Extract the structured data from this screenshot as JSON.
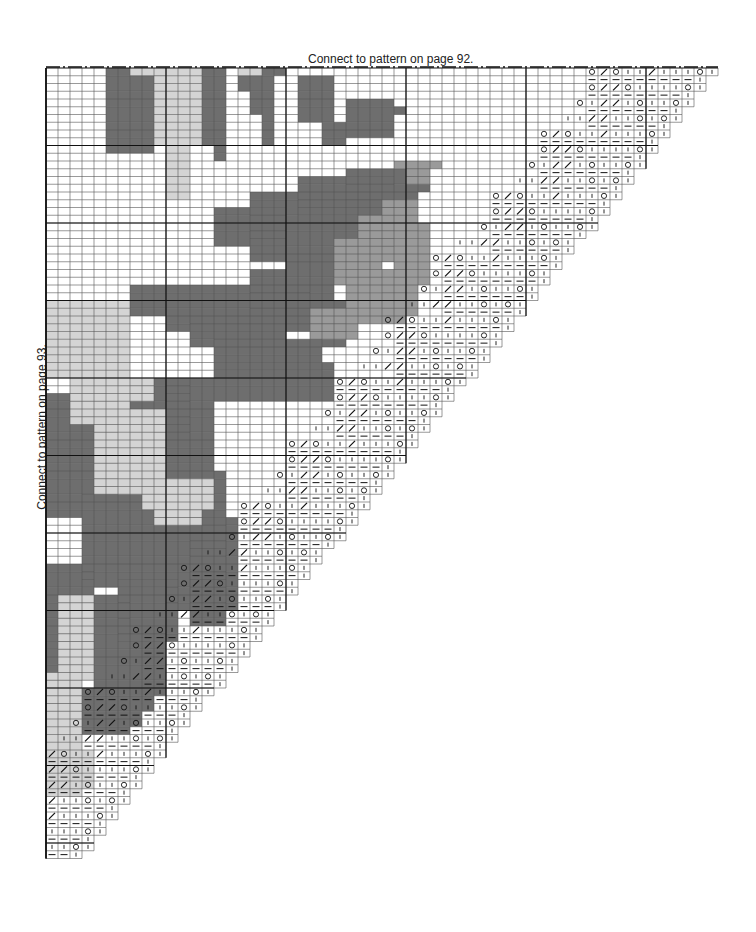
{
  "labels": {
    "top": "Connect to pattern on page 92.",
    "side": "Connect to pattern on page 93."
  },
  "grid": {
    "origin_x": 46,
    "origin_y": 68,
    "cell_w": 12,
    "cell_h": 7.75,
    "cols": 56,
    "rows": 102,
    "major_every": 10
  },
  "colors": {
    "dark": "#6e6e6e",
    "medium": "#9a9a9a",
    "light": "#d4d4d4",
    "grid_line": "#555555",
    "major_line": "#111111"
  },
  "symbols": {
    "yo": "O",
    "k2tog": "/",
    "knit": "ı",
    "purl": "—"
  },
  "lace_rows": [
    [
      "O",
      "/",
      "O",
      "|",
      "|",
      "/",
      "|",
      "|",
      "|",
      "O",
      "|"
    ],
    [
      "—",
      "—",
      "—",
      "—",
      "—",
      "—",
      "—",
      "—",
      "—",
      "|"
    ],
    [
      "O",
      "/",
      "/",
      "O",
      "|",
      "|",
      "|",
      "|",
      "O",
      "|"
    ],
    [
      "—",
      "—",
      "—",
      "—",
      "—",
      "—",
      "—",
      "—",
      "|"
    ],
    [
      "O",
      "|",
      "/",
      "/",
      "|",
      "O",
      "|",
      "|",
      "O",
      "|"
    ],
    [
      "—",
      "—",
      "—",
      "—",
      "—",
      "—",
      "—",
      "|"
    ],
    [
      "|",
      "|",
      "/",
      "/",
      "|",
      "|",
      "O",
      "|",
      "O",
      "|"
    ],
    [
      "—",
      "—",
      "—",
      "—",
      "—",
      "—",
      "|"
    ]
  ],
  "shading": [
    {
      "shade": "dark",
      "rects": [
        [
          5,
          0,
          4,
          11
        ],
        [
          9,
          0,
          1,
          1
        ],
        [
          13,
          0,
          2,
          10
        ],
        [
          14,
          10,
          1,
          2
        ],
        [
          16,
          0,
          3,
          3
        ],
        [
          17,
          3,
          2,
          3
        ],
        [
          18,
          6,
          1,
          4
        ],
        [
          19,
          0,
          1,
          1
        ],
        [
          21,
          1,
          3,
          6
        ],
        [
          23,
          7,
          2,
          3
        ],
        [
          25,
          4,
          4,
          5
        ],
        [
          29,
          5,
          1,
          1
        ],
        [
          30,
          12,
          2,
          4
        ],
        [
          25,
          13,
          5,
          4
        ],
        [
          21,
          14,
          8,
          5
        ],
        [
          17,
          16,
          14,
          4
        ],
        [
          14,
          18,
          6,
          5
        ],
        [
          17,
          20,
          12,
          5
        ],
        [
          20,
          24,
          4,
          7
        ],
        [
          22,
          30,
          3,
          6
        ],
        [
          17,
          26,
          3,
          6
        ],
        [
          20,
          29,
          2,
          4
        ],
        [
          7,
          28,
          3,
          4
        ],
        [
          10,
          28,
          12,
          6
        ],
        [
          12,
          32,
          8,
          4
        ],
        [
          14,
          35,
          9,
          4
        ],
        [
          14,
          38,
          10,
          5
        ],
        [
          7,
          40,
          5,
          8
        ],
        [
          10,
          40,
          4,
          12
        ],
        [
          3,
          42,
          3,
          14
        ],
        [
          0,
          42,
          3,
          16
        ],
        [
          3,
          55,
          7,
          12
        ],
        [
          10,
          52,
          5,
          18
        ],
        [
          12,
          58,
          4,
          14
        ],
        [
          6,
          66,
          5,
          8
        ],
        [
          0,
          64,
          4,
          11
        ],
        [
          4,
          68,
          3,
          12
        ],
        [
          0,
          74,
          3,
          10
        ],
        [
          7,
          72,
          3,
          12
        ],
        [
          7,
          84,
          6,
          5
        ],
        [
          3,
          80,
          4,
          6
        ],
        [
          11,
          78,
          3,
          6
        ],
        [
          12,
          82,
          2,
          3
        ]
      ]
    },
    {
      "shade": "medium",
      "rects": [
        [
          28,
          17,
          3,
          4
        ],
        [
          30,
          12,
          2,
          3
        ],
        [
          26,
          19,
          3,
          6
        ],
        [
          24,
          22,
          4,
          6
        ],
        [
          29,
          20,
          3,
          8
        ],
        [
          25,
          26,
          5,
          7
        ],
        [
          22,
          31,
          4,
          4
        ],
        [
          28,
          28,
          3,
          4
        ],
        [
          29,
          12,
          4,
          1
        ]
      ]
    },
    {
      "shade": "light",
      "rects": [
        [
          9,
          0,
          4,
          10
        ],
        [
          10,
          10,
          2,
          7
        ],
        [
          7,
          0,
          2,
          1
        ],
        [
          16,
          0,
          2,
          1
        ],
        [
          0,
          30,
          7,
          10
        ],
        [
          2,
          36,
          5,
          10
        ],
        [
          4,
          44,
          5,
          11
        ],
        [
          7,
          44,
          3,
          9
        ],
        [
          8,
          53,
          6,
          4
        ],
        [
          9,
          57,
          4,
          2
        ],
        [
          5,
          40,
          4,
          3
        ],
        [
          1,
          68,
          3,
          11
        ],
        [
          0,
          78,
          3,
          16
        ],
        [
          2,
          88,
          2,
          6
        ]
      ]
    }
  ]
}
